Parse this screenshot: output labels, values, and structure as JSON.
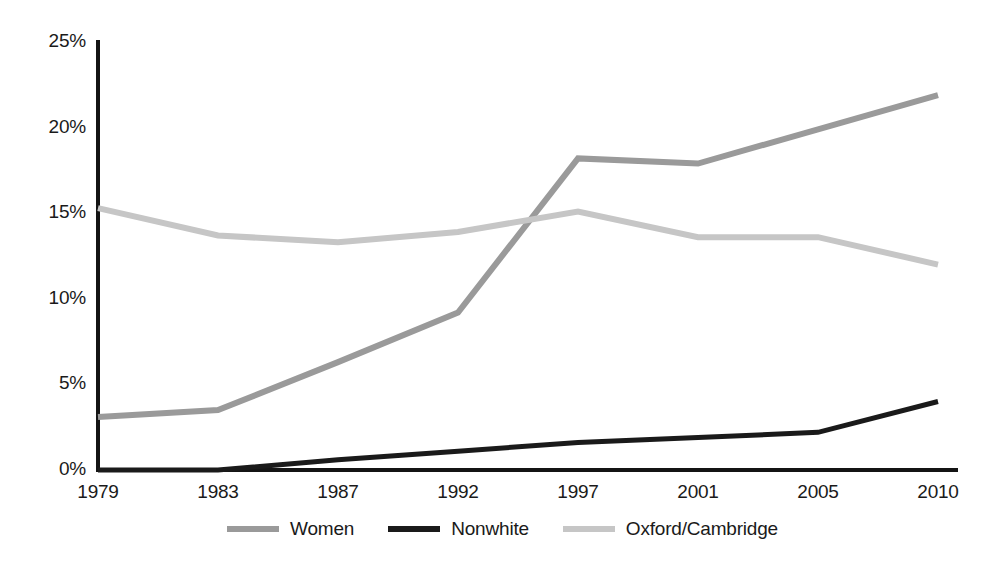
{
  "chart_data": {
    "type": "line",
    "title": "",
    "subtitle": "",
    "xlabel": "",
    "ylabel": "",
    "categories": [
      "1979",
      "1983",
      "1987",
      "1992",
      "1997",
      "2001",
      "2005",
      "2010"
    ],
    "x_tick_labels": [
      "1979",
      "1983",
      "1987",
      "1992",
      "1997",
      "2001",
      "2005",
      "2010"
    ],
    "y_tick_labels": [
      "0%",
      "5%",
      "10%",
      "15%",
      "20%",
      "25%"
    ],
    "y_tick_values": [
      0,
      5,
      10,
      15,
      20,
      25
    ],
    "ylim": [
      0,
      25
    ],
    "grid": false,
    "legend_position": "bottom",
    "series": [
      {
        "name": "Women",
        "color": "#9a9a9a",
        "values": [
          3.1,
          3.5,
          6.3,
          9.2,
          18.2,
          17.9,
          19.9,
          21.9
        ]
      },
      {
        "name": "Nonwhite",
        "color": "#1a1a1a",
        "values": [
          0.0,
          0.0,
          0.6,
          1.1,
          1.6,
          1.9,
          2.2,
          4.0
        ]
      },
      {
        "name": "Oxford/Cambridge",
        "color": "#c6c6c6",
        "values": [
          15.3,
          13.7,
          13.3,
          13.9,
          15.1,
          13.6,
          13.6,
          12.0
        ]
      }
    ]
  },
  "axis": {
    "color": "#141414",
    "line_width": 4
  },
  "legend": {
    "items": [
      {
        "label": "Women",
        "color": "#9a9a9a"
      },
      {
        "label": "Nonwhite",
        "color": "#1a1a1a"
      },
      {
        "label": "Oxford/Cambridge",
        "color": "#c6c6c6"
      }
    ]
  }
}
